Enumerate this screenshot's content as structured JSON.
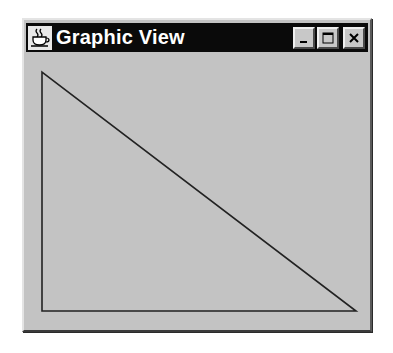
{
  "window": {
    "title": "Graphic View",
    "icon": "java-coffee-cup-icon",
    "controls": [
      {
        "name": "minimize",
        "icon": "minimize-icon"
      },
      {
        "name": "maximize",
        "icon": "maximize-icon"
      },
      {
        "name": "close",
        "icon": "close-icon"
      }
    ],
    "colors": {
      "titlebar": "#0a0a0a",
      "title_text": "#ffffff",
      "client_area": "#c3c3c3",
      "stroke": "#222222"
    }
  },
  "drawing": {
    "shape": "triangle",
    "points": [
      [
        42,
        72
      ],
      [
        42,
        311
      ],
      [
        356,
        311
      ]
    ]
  }
}
